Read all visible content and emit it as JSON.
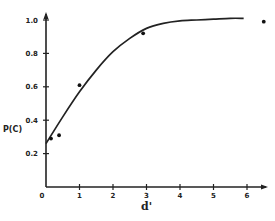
{
  "chart_data": {
    "type": "scatter",
    "title": "",
    "xlabel": "d'",
    "ylabel": "P(C)",
    "xlim": [
      0,
      6.6
    ],
    "ylim": [
      0,
      1.05
    ],
    "x_ticks": [
      0,
      1,
      2,
      3,
      4,
      5,
      6
    ],
    "x_tick_labels": [
      "0",
      "1",
      "2",
      "3",
      "4",
      "5",
      "6"
    ],
    "y_ticks": [
      0.2,
      0.4,
      0.6,
      0.8,
      1.0
    ],
    "y_tick_labels": [
      "0.2",
      "0.4",
      "0.6",
      "0.8",
      "1.0"
    ],
    "grid": false,
    "legend": null,
    "series": [
      {
        "name": "observed",
        "kind": "points",
        "x": [
          0.15,
          0.39,
          1.0,
          2.9,
          6.5
        ],
        "y": [
          0.29,
          0.31,
          0.61,
          0.92,
          0.99
        ]
      },
      {
        "name": "fitted curve",
        "kind": "line",
        "x": [
          0,
          0.5,
          1.0,
          1.5,
          2.0,
          2.5,
          3.0,
          3.5,
          4.0,
          4.5,
          5.0,
          5.5,
          5.9
        ],
        "y": [
          0.26,
          0.42,
          0.57,
          0.7,
          0.81,
          0.89,
          0.95,
          0.98,
          0.995,
          1.0,
          1.005,
          1.01,
          1.01
        ]
      }
    ]
  }
}
